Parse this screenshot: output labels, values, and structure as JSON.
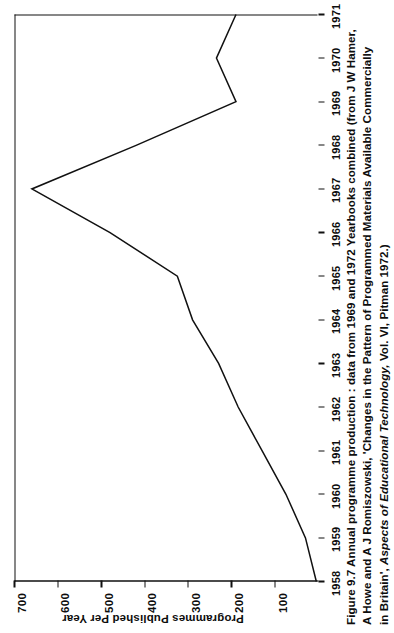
{
  "figure": {
    "caption_lines": [
      "Figure 9.7 Annual programme production : data from 1969 and 1972 Yearbooks combined (from J W Hamer,",
      "A Howe and A J Romiszowski, 'Changes in the Pattern of Programmed Materials Available Commercially",
      "in Britain', Aspects of Educational Technology, Vol. VI, Pitman 1972.)"
    ],
    "caption_line3_pre": "in Britain', ",
    "caption_line3_italic": "Aspects of Educational Technology,",
    "caption_line3_post": " Vol. VI, Pitman 1972.)"
  },
  "chart_data": {
    "type": "line",
    "title": "",
    "xlabel": "",
    "ylabel": "Programmes Published Per Year",
    "x": [
      1958,
      1959,
      1960,
      1961,
      1962,
      1963,
      1964,
      1965,
      1966,
      1967,
      1968,
      1969,
      1970,
      1971
    ],
    "x_tick_labels": [
      "1958",
      "1959",
      "1960",
      "1961",
      "1962",
      "1963",
      "1964",
      "1965",
      "1966",
      "1967",
      "1968",
      "1969",
      "1970",
      "1971"
    ],
    "values": [
      5,
      30,
      75,
      130,
      185,
      230,
      290,
      325,
      480,
      660,
      420,
      190,
      235,
      190
    ],
    "y_ticks": [
      100,
      200,
      300,
      400,
      500,
      600,
      700
    ],
    "y_tick_labels": [
      "100",
      "200",
      "300",
      "400",
      "500",
      "600",
      "700"
    ],
    "xlim": [
      1958,
      1971
    ],
    "ylim": [
      0,
      700
    ],
    "grid": false,
    "legend": false,
    "line_color": "#111111",
    "background_color": "#ffffff"
  }
}
